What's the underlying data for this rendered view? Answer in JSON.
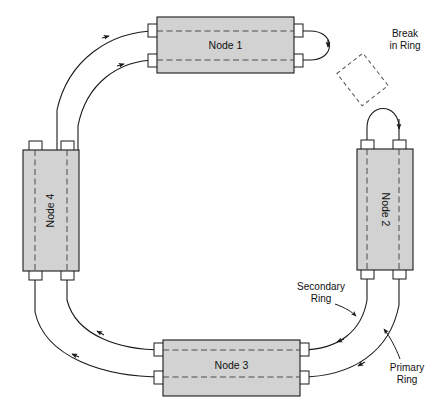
{
  "diagram": {
    "type": "network-ring-diagram",
    "colors": {
      "node_fill": "#d2d2d2",
      "node_stroke": "#1a1a1a",
      "tab_fill": "#ffffff",
      "internal_dash": "#4a4a4a",
      "ring_line": "#1a1a1a",
      "break_outline": "#555555",
      "background": "#ffffff"
    },
    "nodes": [
      {
        "id": "node-1",
        "label": "Node 1",
        "orientation": "horizontal",
        "text_rotation": 0,
        "x": 157,
        "y": 17,
        "width": 137,
        "height": 56,
        "tabs": 4,
        "internal_paths": 2
      },
      {
        "id": "node-2",
        "label": "Node 2",
        "orientation": "vertical",
        "text_rotation": 90,
        "x": 357,
        "y": 149,
        "width": 56,
        "height": 121,
        "tabs": 4,
        "internal_paths": 2
      },
      {
        "id": "node-3",
        "label": "Node 3",
        "orientation": "horizontal",
        "text_rotation": 0,
        "x": 163,
        "y": 340,
        "width": 137,
        "height": 56,
        "tabs": 4,
        "internal_paths": 2
      },
      {
        "id": "node-4",
        "label": "Node 4",
        "orientation": "vertical",
        "text_rotation": -90,
        "x": 23,
        "y": 150,
        "width": 56,
        "height": 121,
        "tabs": 4,
        "internal_paths": 2
      }
    ],
    "annotations": [
      {
        "id": "break-in-ring",
        "line_1": "Break",
        "line_2": "in Ring",
        "x": 405,
        "y": 34,
        "marker": "dashed-rotated-rectangle"
      },
      {
        "id": "secondary-ring",
        "line_1": "Secondary",
        "line_2": "Ring",
        "x": 321,
        "y": 288,
        "points_to": "inner-ring-curve"
      },
      {
        "id": "primary-ring",
        "line_1": "Primary",
        "line_2": "Ring",
        "x": 407,
        "y": 369,
        "points_to": "outer-ring-curve"
      }
    ],
    "wraps": [
      {
        "id": "wrap-node-1",
        "at": "node-1-right",
        "description": "loopback arc joining primary and secondary at Node 1"
      },
      {
        "id": "wrap-node-2",
        "at": "node-2-top",
        "description": "loopback arc joining primary and secondary at Node 2"
      }
    ],
    "caption": ""
  }
}
